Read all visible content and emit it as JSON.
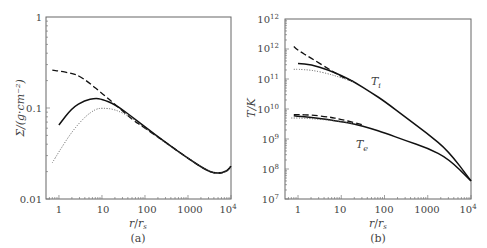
{
  "chart_data": [
    {
      "panel": "(a)",
      "type": "line",
      "title": "",
      "xlabel": "r/r_s",
      "ylabel": "Σ/(g·cm^-2)",
      "xscale": "log",
      "yscale": "log",
      "xlim": [
        0.5,
        10000
      ],
      "ylim": [
        0.01,
        1
      ],
      "xticks": [
        "1",
        "10",
        "100",
        "1000",
        "10^4"
      ],
      "yticks": [
        "0.01",
        "0.1",
        "1"
      ],
      "grid": false,
      "legend": null,
      "series": [
        {
          "name": "dashed",
          "style": "dashed",
          "x": [
            0.7,
            1,
            2,
            3,
            5,
            10,
            20,
            50,
            100,
            300,
            1000,
            3000,
            5000,
            8000,
            10000
          ],
          "y": [
            0.26,
            0.255,
            0.24,
            0.225,
            0.19,
            0.145,
            0.11,
            0.075,
            0.06,
            0.042,
            0.028,
            0.02,
            0.019,
            0.02,
            0.023
          ]
        },
        {
          "name": "solid",
          "style": "solid",
          "x": [
            1,
            2,
            4,
            7,
            10,
            20,
            50,
            100,
            300,
            1000,
            3000,
            5000,
            8000,
            10000
          ],
          "y": [
            0.065,
            0.1,
            0.122,
            0.128,
            0.125,
            0.11,
            0.08,
            0.062,
            0.042,
            0.028,
            0.02,
            0.019,
            0.02,
            0.023
          ]
        },
        {
          "name": "dotted",
          "style": "dotted",
          "x": [
            0.7,
            1,
            2,
            4,
            7,
            10,
            20,
            50,
            100,
            300,
            1000,
            3000,
            5000,
            8000,
            10000
          ],
          "y": [
            0.025,
            0.033,
            0.055,
            0.08,
            0.097,
            0.1,
            0.097,
            0.078,
            0.06,
            0.041,
            0.028,
            0.02,
            0.019,
            0.02,
            0.023
          ]
        }
      ],
      "caption": "(a)"
    },
    {
      "panel": "(b)",
      "type": "line",
      "title": "",
      "xlabel": "r/r_s",
      "ylabel": "T/K",
      "xscale": "log",
      "yscale": "log",
      "xlim": [
        0.5,
        10000
      ],
      "ylim": [
        10000000.0,
        10000000000000.0
      ],
      "xticks": [
        "1",
        "10",
        "100",
        "1000",
        "10^4"
      ],
      "yticks": [
        "10^7",
        "10^8",
        "10^9",
        "10^10",
        "10^11",
        "10^12",
        "10^12"
      ],
      "grid": false,
      "annotations": [
        "T_i",
        "T_e"
      ],
      "series": [
        {
          "name": "T_i dashed",
          "style": "dashed",
          "x": [
            0.8,
            1,
            2,
            5,
            10,
            20
          ],
          "y": [
            1200000000000.0,
            900000000000.0,
            500000000000.0,
            220000000000.0,
            120000000000.0,
            80000000000.0
          ]
        },
        {
          "name": "T_i solid",
          "style": "solid",
          "x": [
            1,
            2,
            5,
            10,
            20,
            50,
            100,
            300,
            1000,
            3000,
            10000
          ],
          "y": [
            330000000000.0,
            300000000000.0,
            200000000000.0,
            130000000000.0,
            80000000000.0,
            35000000000.0,
            18000000000.0,
            5500000000.0,
            1500000000.0,
            400000000.0,
            40000000.0
          ]
        },
        {
          "name": "T_i dotted",
          "style": "dotted",
          "x": [
            0.8,
            1,
            2,
            5,
            10,
            20
          ],
          "y": [
            210000000000.0,
            210000000000.0,
            200000000000.0,
            150000000000.0,
            110000000000.0,
            80000000000.0
          ]
        },
        {
          "name": "T_e dashed",
          "style": "dashed",
          "x": [
            0.8,
            1,
            2,
            5,
            10,
            20,
            30
          ],
          "y": [
            6500000000.0,
            6500000000.0,
            6300000000.0,
            5500000000.0,
            4500000000.0,
            3500000000.0,
            3000000000.0
          ]
        },
        {
          "name": "T_e solid",
          "style": "solid",
          "x": [
            0.8,
            1,
            2,
            5,
            10,
            20,
            50,
            100,
            300,
            1000,
            3000,
            10000
          ],
          "y": [
            6000000000.0,
            5800000000.0,
            5200000000.0,
            4400000000.0,
            3800000000.0,
            3200000000.0,
            2200000000.0,
            1600000000.0,
            900000000.0,
            500000000.0,
            220000000.0,
            40000000.0
          ]
        },
        {
          "name": "T_e dotted",
          "style": "dotted",
          "x": [
            0.7,
            1,
            2,
            5,
            10,
            20
          ],
          "y": [
            5000000000.0,
            5000000000.0,
            4800000000.0,
            4300000000.0,
            3800000000.0,
            3200000000.0
          ]
        }
      ],
      "caption": "(b)"
    }
  ],
  "labels": {
    "a": {
      "yticks": [
        "1",
        "0.1",
        "0.01"
      ],
      "xticks": [
        "1",
        "10",
        "100",
        "1000",
        "10"
      ],
      "x_last_sup": "4",
      "ylabel": "Σ/(g·cm⁻²)",
      "xlabel_r": "r",
      "xlabel_rs": "r",
      "xlabel_sub": "s",
      "caption": "(a)"
    },
    "b": {
      "yticks_base": [
        "10",
        "10",
        "10",
        "10",
        "10",
        "10",
        "10"
      ],
      "yticks_sup": [
        "12",
        "12",
        "11",
        "10",
        "9",
        "8",
        "7"
      ],
      "xticks": [
        "1",
        "10",
        "100",
        "1000",
        "10"
      ],
      "x_last_sup": "4",
      "ylabel": "T/K",
      "xlabel_r": "r",
      "xlabel_rs": "r",
      "xlabel_sub": "s",
      "caption": "(b)",
      "ann_ti": "T",
      "ann_ti_sub": "i",
      "ann_te": "T",
      "ann_te_sub": "e"
    }
  }
}
